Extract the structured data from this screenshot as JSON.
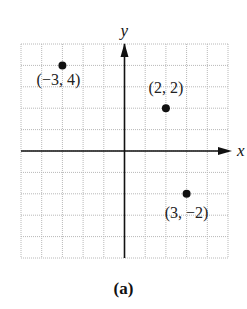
{
  "figure": {
    "caption": "(a)",
    "x_axis_label": "x",
    "y_axis_label": "y",
    "grid": {
      "x_min": -5,
      "x_max": 5,
      "y_min": -5,
      "y_max": 5,
      "step": 1,
      "left_px": 21,
      "right_px": 228,
      "top_px": 44,
      "bottom_px": 258,
      "line_color": "#b8b8b8",
      "axis_color": "#111111"
    },
    "points": [
      {
        "x": -3,
        "y": 4,
        "label": "(−3, 4)",
        "label_dx": -4,
        "label_dy": 20
      },
      {
        "x": 2,
        "y": 2,
        "label": "(2, 2)",
        "label_dx": 0,
        "label_dy": -15
      },
      {
        "x": 3,
        "y": -2,
        "label": "(3, −2)",
        "label_dx": 0,
        "label_dy": 24
      }
    ],
    "point_color": "#111111"
  },
  "chart_data": {
    "type": "scatter",
    "title": "",
    "caption": "(a)",
    "xlabel": "x",
    "ylabel": "y",
    "xlim": [
      -5,
      5
    ],
    "ylim": [
      -5,
      5
    ],
    "grid": true,
    "legend": "none",
    "series": [
      {
        "name": "points",
        "x": [
          -3,
          2,
          3
        ],
        "y": [
          4,
          2,
          -2
        ],
        "labels": [
          "(−3, 4)",
          "(2, 2)",
          "(3, −2)"
        ]
      }
    ]
  }
}
